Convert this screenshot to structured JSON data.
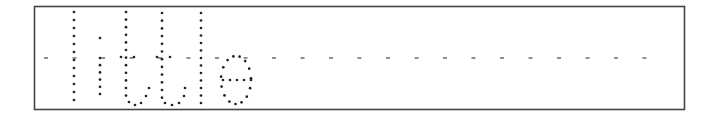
{
  "worksheet": {
    "word": "little",
    "instruction_type": "dotted tracing letters",
    "border_color": "#444444",
    "dot_color": "#222222",
    "midline_color": "#555555"
  }
}
